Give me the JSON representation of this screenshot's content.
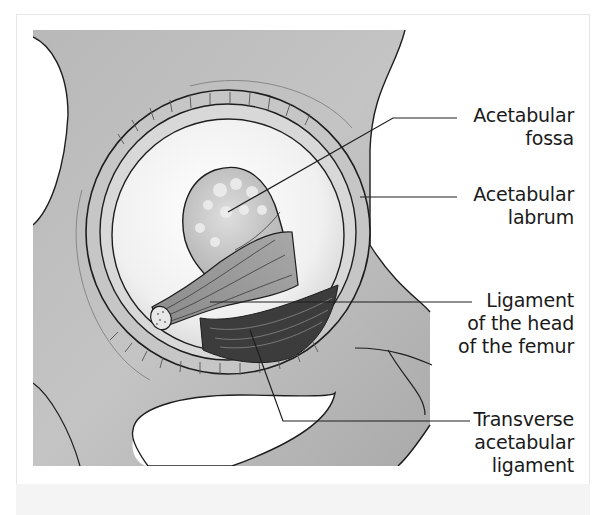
{
  "figure": {
    "colors": {
      "bone_gray": "#b4b4b4",
      "bone_gray_light": "#cfcfcf",
      "fossa_white": "#f4f4f4",
      "ligament_dark": "#3c3c3c",
      "outline": "#1e1e1e",
      "label_text": "#1a1a1a"
    }
  },
  "labels": [
    {
      "id": "acetabular-fossa",
      "lines": [
        "Acetabular",
        "fossa"
      ]
    },
    {
      "id": "acetabular-labrum",
      "lines": [
        "Acetabular",
        "labrum"
      ]
    },
    {
      "id": "ligament-head-femur",
      "lines": [
        "Ligament",
        "of the head",
        "of the femur"
      ]
    },
    {
      "id": "transverse-acetabular-ligament",
      "lines": [
        "Transverse",
        "acetabular",
        "ligament"
      ]
    }
  ]
}
